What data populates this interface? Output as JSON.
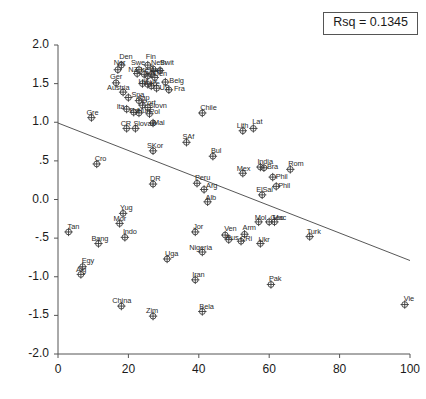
{
  "chart_data": {
    "type": "scatter",
    "title": "",
    "xlabel": "",
    "ylabel": "VA scores",
    "xlim": [
      0,
      100
    ],
    "ylim": [
      -2.0,
      2.0
    ],
    "xticks": [
      "0",
      "20",
      "40",
      "60",
      "80",
      "100"
    ],
    "yticks": [
      "2.0",
      "1.5",
      "1.0",
      ".5",
      "0.0",
      "-.5",
      "-1.0",
      "-1.5",
      "-2.0"
    ],
    "grid": false,
    "legend": "none",
    "annotation": "Rsq = 0.1345",
    "fit_line": {
      "type": "linear",
      "x_start": 0,
      "y_start": 0.99,
      "x_end": 100,
      "y_end": -0.79
    },
    "points": [
      {
        "label": "Den",
        "x": 18.0,
        "y": 1.74,
        "lx": -2,
        "ly": -12
      },
      {
        "label": "Nor",
        "x": 17.0,
        "y": 1.68,
        "lx": -4,
        "ly": -11
      },
      {
        "label": "Ger",
        "x": 16.5,
        "y": 1.51,
        "lx": -6,
        "ly": -10
      },
      {
        "label": "Swe",
        "x": 23.0,
        "y": 1.68,
        "lx": -8,
        "ly": -11
      },
      {
        "label": "Fin",
        "x": 25.5,
        "y": 1.74,
        "lx": -2,
        "ly": -12
      },
      {
        "label": "Neth",
        "x": 27.0,
        "y": 1.69,
        "lx": -2,
        "ly": -10
      },
      {
        "label": "Swit",
        "x": 29.0,
        "y": 1.67,
        "lx": 0,
        "ly": -11
      },
      {
        "label": "NZ",
        "x": 22.5,
        "y": 1.63,
        "lx": -9,
        "ly": -8
      },
      {
        "label": "Ire",
        "x": 24.5,
        "y": 1.62,
        "lx": -4,
        "ly": -8
      },
      {
        "label": "Can",
        "x": 25.5,
        "y": 1.6,
        "lx": -3,
        "ly": -8
      },
      {
        "label": "Aus",
        "x": 26.5,
        "y": 1.62,
        "lx": -1,
        "ly": -8
      },
      {
        "label": "Den2",
        "x": 27.5,
        "y": 1.58,
        "lx": -1,
        "ly": -7
      },
      {
        "label": "Belg",
        "x": 30.5,
        "y": 1.52,
        "lx": 4,
        "ly": -5
      },
      {
        "label": "UK",
        "x": 24.0,
        "y": 1.5,
        "lx": -4,
        "ly": -6
      },
      {
        "label": "Lux",
        "x": 25.5,
        "y": 1.49,
        "lx": -2,
        "ly": -6
      },
      {
        "label": "Ice",
        "x": 26.5,
        "y": 1.47,
        "lx": -1,
        "ly": -6
      },
      {
        "label": "US",
        "x": 28.0,
        "y": 1.44,
        "lx": 3,
        "ly": -4
      },
      {
        "label": "Fra",
        "x": 31.5,
        "y": 1.42,
        "lx": 5,
        "ly": -5
      },
      {
        "label": "Austria",
        "x": 18.5,
        "y": 1.39,
        "lx": -16,
        "ly": -8
      },
      {
        "label": "Spa",
        "x": 20.0,
        "y": 1.32,
        "lx": 3,
        "ly": -7
      },
      {
        "label": "Jap",
        "x": 23.0,
        "y": 1.28,
        "lx": -1,
        "ly": -7
      },
      {
        "label": "Port",
        "x": 24.0,
        "y": 1.22,
        "lx": 0,
        "ly": -6
      },
      {
        "label": "Slovn",
        "x": 25.5,
        "y": 1.19,
        "lx": 1,
        "ly": -6
      },
      {
        "label": "Ita",
        "x": 19.5,
        "y": 1.17,
        "lx": -10,
        "ly": -6
      },
      {
        "label": "Est",
        "x": 21.5,
        "y": 1.13,
        "lx": -4,
        "ly": -5
      },
      {
        "label": "Hun",
        "x": 23.0,
        "y": 1.12,
        "lx": -2,
        "ly": -6
      },
      {
        "label": "Pol",
        "x": 26.0,
        "y": 1.11,
        "lx": 0,
        "ly": -6
      },
      {
        "label": "Gre",
        "x": 9.5,
        "y": 1.06,
        "lx": -5,
        "ly": -9
      },
      {
        "label": "CR",
        "x": 19.5,
        "y": 0.92,
        "lx": -6,
        "ly": -8
      },
      {
        "label": "Slovak",
        "x": 22.0,
        "y": 0.92,
        "lx": -2,
        "ly": -8
      },
      {
        "label": "Mal",
        "x": 27.0,
        "y": 0.99,
        "lx": 0,
        "ly": -4
      },
      {
        "label": "Chile",
        "x": 41.0,
        "y": 1.12,
        "lx": -2,
        "ly": -9
      },
      {
        "label": "Lith",
        "x": 52.5,
        "y": 0.89,
        "lx": -6,
        "ly": -9
      },
      {
        "label": "Lat",
        "x": 55.5,
        "y": 0.92,
        "lx": -1,
        "ly": -10
      },
      {
        "label": "SAf",
        "x": 36.5,
        "y": 0.74,
        "lx": -4,
        "ly": -9
      },
      {
        "label": "SKor",
        "x": 27.0,
        "y": 0.63,
        "lx": -6,
        "ly": -9
      },
      {
        "label": "Bul",
        "x": 44.0,
        "y": 0.56,
        "lx": -2,
        "ly": -9
      },
      {
        "label": "Cro",
        "x": 11.0,
        "y": 0.46,
        "lx": -2,
        "ly": -9
      },
      {
        "label": "Mex",
        "x": 52.5,
        "y": 0.34,
        "lx": -6,
        "ly": -8
      },
      {
        "label": "India",
        "x": 57.5,
        "y": 0.42,
        "lx": -3,
        "ly": -9
      },
      {
        "label": "Bra",
        "x": 58.5,
        "y": 0.41,
        "lx": 3,
        "ly": -5
      },
      {
        "label": "Rom",
        "x": 66.0,
        "y": 0.39,
        "lx": -2,
        "ly": -9
      },
      {
        "label": "Phil",
        "x": 61.0,
        "y": 0.29,
        "lx": 3,
        "ly": -4
      },
      {
        "label": "Peru",
        "x": 39.5,
        "y": 0.21,
        "lx": -2,
        "ly": -9
      },
      {
        "label": "Arg",
        "x": 41.5,
        "y": 0.13,
        "lx": 2,
        "ly": -7
      },
      {
        "label": "DR",
        "x": 27.0,
        "y": 0.2,
        "lx": -3,
        "ly": -9
      },
      {
        "label": "ElSal",
        "x": 58.0,
        "y": 0.06,
        "lx": -6,
        "ly": -9
      },
      {
        "label": "Phil2",
        "x": 62.0,
        "y": 0.17,
        "lx": 2,
        "ly": -4
      },
      {
        "label": "Alb",
        "x": 42.5,
        "y": -0.03,
        "lx": -2,
        "ly": -8
      },
      {
        "label": "Yug",
        "x": 18.5,
        "y": -0.18,
        "lx": -3,
        "ly": -9
      },
      {
        "label": "Mor",
        "x": 17.5,
        "y": -0.31,
        "lx": -6,
        "ly": -8
      },
      {
        "label": "Indo",
        "x": 19.0,
        "y": -0.49,
        "lx": -2,
        "ly": -9
      },
      {
        "label": "Mol",
        "x": 57.0,
        "y": -0.29,
        "lx": -4,
        "ly": -8
      },
      {
        "label": "Mac",
        "x": 61.5,
        "y": -0.29,
        "lx": -2,
        "ly": -8
      },
      {
        "label": "Geo",
        "x": 60.0,
        "y": -0.29,
        "lx": 1,
        "ly": -8
      },
      {
        "label": "Tan",
        "x": 3.0,
        "y": -0.42,
        "lx": -1,
        "ly": -9
      },
      {
        "label": "Bang",
        "x": 11.5,
        "y": -0.57,
        "lx": -7,
        "ly": -9
      },
      {
        "label": "Jor",
        "x": 39.0,
        "y": -0.42,
        "lx": -2,
        "ly": -9
      },
      {
        "label": "Ven",
        "x": 47.5,
        "y": -0.46,
        "lx": -1,
        "ly": -10
      },
      {
        "label": "Arm",
        "x": 53.0,
        "y": -0.45,
        "lx": -2,
        "ly": -10
      },
      {
        "label": "Rus",
        "x": 48.5,
        "y": -0.52,
        "lx": -3,
        "ly": -6
      },
      {
        "label": "CRi",
        "x": 52.0,
        "y": -0.54,
        "lx": -1,
        "ly": -6
      },
      {
        "label": "Ukr",
        "x": 57.5,
        "y": -0.57,
        "lx": -2,
        "ly": -8
      },
      {
        "label": "Turk",
        "x": 71.5,
        "y": -0.48,
        "lx": -3,
        "ly": -9
      },
      {
        "label": "Nigeria",
        "x": 41.0,
        "y": -0.68,
        "lx": -13,
        "ly": -8
      },
      {
        "label": "Uga",
        "x": 31.0,
        "y": -0.77,
        "lx": -2,
        "ly": -9
      },
      {
        "label": "Egy",
        "x": 7.0,
        "y": -0.87,
        "lx": -1,
        "ly": -10
      },
      {
        "label": "Alg",
        "x": 6.5,
        "y": -0.97,
        "lx": -5,
        "ly": -8
      },
      {
        "label": "Iran",
        "x": 39.0,
        "y": -1.04,
        "lx": -3,
        "ly": -9
      },
      {
        "label": "Pak",
        "x": 60.5,
        "y": -1.1,
        "lx": -2,
        "ly": -9
      },
      {
        "label": "China",
        "x": 18.0,
        "y": -1.38,
        "lx": -9,
        "ly": -9
      },
      {
        "label": "Zim",
        "x": 27.0,
        "y": -1.51,
        "lx": -7,
        "ly": -9
      },
      {
        "label": "Bela",
        "x": 41.0,
        "y": -1.45,
        "lx": -3,
        "ly": -9
      },
      {
        "label": "Vie",
        "x": 98.5,
        "y": -1.36,
        "lx": -1,
        "ly": -10
      }
    ]
  },
  "annotation_box": {
    "text": "Rsq = 0.1345"
  },
  "axes": {
    "y_title": "VA scores"
  }
}
